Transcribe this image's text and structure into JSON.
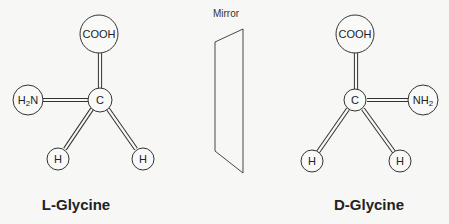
{
  "mirror": {
    "label": "Mirror"
  },
  "left_molecule": {
    "name": "L-Glycine",
    "center": "C",
    "top": "COOH",
    "side": "H2N",
    "bottom_left": "H",
    "bottom_right": "H"
  },
  "right_molecule": {
    "name": "D-Glycine",
    "center": "C",
    "top": "COOH",
    "side": "NH2",
    "bottom_left": "H",
    "bottom_right": "H"
  },
  "colors": {
    "line": "#333333",
    "background": "#f7f7f5"
  }
}
